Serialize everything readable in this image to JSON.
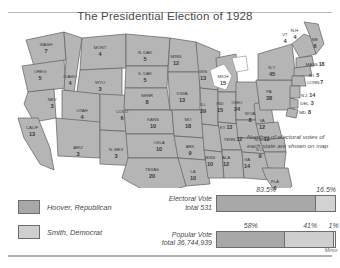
{
  "map": {
    "title": "The Presidential Election of 1928",
    "annotation": "Number of electoral votes of each state are shown on map",
    "states": [
      {
        "name": "WASH",
        "votes": "7",
        "x": 42,
        "y": 30,
        "layout": "stack"
      },
      {
        "name": "OREG",
        "votes": "5",
        "x": 36,
        "y": 57,
        "layout": "stack"
      },
      {
        "name": "IDAHO",
        "votes": "4",
        "x": 66,
        "y": 62,
        "layout": "stack"
      },
      {
        "name": "MONT",
        "votes": "4",
        "x": 96,
        "y": 33,
        "layout": "stack"
      },
      {
        "name": "WYO",
        "votes": "3",
        "x": 96,
        "y": 68,
        "layout": "stack"
      },
      {
        "name": "NEV",
        "votes": "3",
        "x": 48,
        "y": 85,
        "layout": "stack"
      },
      {
        "name": "UTAH",
        "votes": "4",
        "x": 78,
        "y": 96,
        "layout": "stack"
      },
      {
        "name": "CALIF",
        "votes": "13",
        "x": 28,
        "y": 113,
        "layout": "stack"
      },
      {
        "name": "ARIZ",
        "votes": "3",
        "x": 74,
        "y": 133,
        "layout": "stack"
      },
      {
        "name": "COLO",
        "votes": "6",
        "x": 118,
        "y": 97,
        "layout": "stack"
      },
      {
        "name": "N. MEX",
        "votes": "3",
        "x": 112,
        "y": 135,
        "layout": "stack"
      },
      {
        "name": "N. DAK",
        "votes": "5",
        "x": 141,
        "y": 38,
        "layout": "stack"
      },
      {
        "name": "S. DAK",
        "votes": "5",
        "x": 141,
        "y": 59,
        "layout": "stack"
      },
      {
        "name": "NEBR",
        "votes": "8",
        "x": 143,
        "y": 81,
        "layout": "stack"
      },
      {
        "name": "KANS",
        "votes": "10",
        "x": 149,
        "y": 105,
        "layout": "stack"
      },
      {
        "name": "OKLA",
        "votes": "10",
        "x": 155,
        "y": 128,
        "layout": "stack"
      },
      {
        "name": "TEXAS",
        "votes": "20",
        "x": 148,
        "y": 155,
        "layout": "stack"
      },
      {
        "name": "MINN",
        "votes": "12",
        "x": 172,
        "y": 42,
        "layout": "stack"
      },
      {
        "name": "IOWA",
        "votes": "13",
        "x": 178,
        "y": 79,
        "layout": "stack"
      },
      {
        "name": "MO",
        "votes": "18",
        "x": 184,
        "y": 105,
        "layout": "stack"
      },
      {
        "name": "ARK",
        "votes": "9",
        "x": 186,
        "y": 132,
        "layout": "stack"
      },
      {
        "name": "LA",
        "votes": "10",
        "x": 189,
        "y": 157,
        "layout": "stack"
      },
      {
        "name": "WIS",
        "votes": "13",
        "x": 199,
        "y": 57,
        "layout": "stack"
      },
      {
        "name": "ILL",
        "votes": "29",
        "x": 199,
        "y": 90,
        "layout": "stack"
      },
      {
        "name": "MISS",
        "votes": "10",
        "x": 206,
        "y": 143,
        "layout": "stack"
      },
      {
        "name": "MICH",
        "votes": "15",
        "x": 219,
        "y": 62,
        "layout": "stack"
      },
      {
        "name": "IND",
        "votes": "15",
        "x": 216,
        "y": 89,
        "layout": "stack"
      },
      {
        "name": "ALA",
        "votes": "12",
        "x": 222,
        "y": 143,
        "layout": "stack"
      },
      {
        "name": "OHIO",
        "votes": "24",
        "x": 233,
        "y": 88,
        "layout": "stack"
      },
      {
        "name": "KY",
        "votes": "13",
        "x": 222,
        "y": 110,
        "layout": "inline"
      },
      {
        "name": "TENN",
        "votes": "12",
        "x": 229,
        "y": 122,
        "layout": "inline"
      },
      {
        "name": "GA",
        "votes": "14",
        "x": 243,
        "y": 145,
        "layout": "stack"
      },
      {
        "name": "W.VA",
        "votes": "8",
        "x": 246,
        "y": 99,
        "layout": "stack"
      },
      {
        "name": "VA",
        "votes": "12",
        "x": 258,
        "y": 106,
        "layout": "stack"
      },
      {
        "name": "N.C.",
        "votes": "12",
        "x": 258,
        "y": 122,
        "layout": "inline"
      },
      {
        "name": "S.C.",
        "votes": "9",
        "x": 256,
        "y": 135,
        "layout": "stack"
      },
      {
        "name": "FLA",
        "votes": "6",
        "x": 271,
        "y": 167,
        "layout": "stack"
      },
      {
        "name": "PA",
        "votes": "38",
        "x": 265,
        "y": 77,
        "layout": "stack"
      },
      {
        "name": "N.Y.",
        "votes": "45",
        "x": 268,
        "y": 53,
        "layout": "stack"
      },
      {
        "name": "VT",
        "votes": "4",
        "x": 281,
        "y": 20,
        "layout": "stack"
      },
      {
        "name": "N.H.",
        "votes": "4",
        "x": 291,
        "y": 16,
        "layout": "stack"
      },
      {
        "name": "ME",
        "votes": "6",
        "x": 311,
        "y": 25,
        "layout": "stack"
      },
      {
        "name": "MASS",
        "votes": "18",
        "x": 311,
        "y": 47,
        "layout": "inline"
      },
      {
        "name": "R.I.",
        "votes": "5",
        "x": 310,
        "y": 58,
        "layout": "inline"
      },
      {
        "name": "CONN",
        "votes": "7",
        "x": 311,
        "y": 65,
        "layout": "inline"
      },
      {
        "name": "N.J.",
        "votes": "14",
        "x": 304,
        "y": 78,
        "layout": "inline"
      },
      {
        "name": "DEL.",
        "votes": "3",
        "x": 303,
        "y": 86,
        "layout": "inline"
      },
      {
        "name": "MD.",
        "votes": "8",
        "x": 301,
        "y": 95,
        "layout": "inline"
      }
    ]
  },
  "legend": {
    "items": [
      {
        "label": "Hoover, Republican",
        "color": "#a8a8a8"
      },
      {
        "label": "Smith, Democrat",
        "color": "#cfcfcf"
      }
    ]
  },
  "chart_data": {
    "type": "bar",
    "title": "The Presidential Election of 1928",
    "orientation": "horizontal-stacked",
    "bars": [
      {
        "caption_line1": "Electoral Vote",
        "caption_line2": "total 531",
        "segments": [
          {
            "name": "Hoover, Republican",
            "label": "83.5%",
            "value": 83.5,
            "color": "#a8a8a8"
          },
          {
            "name": "Smith, Democrat",
            "label": "16.5%",
            "value": 16.5,
            "color": "#d2d2d2"
          }
        ]
      },
      {
        "caption_line1": "Popular Vote",
        "caption_line2": "total 36,744,939",
        "segments": [
          {
            "name": "Hoover, Republican",
            "label": "58%",
            "value": 58,
            "color": "#a8a8a8"
          },
          {
            "name": "Smith, Democrat",
            "label": "41%",
            "value": 41,
            "color": "#cfcfcf"
          },
          {
            "name": "Minor",
            "label": "1%",
            "value": 1,
            "color": "#ededed",
            "note": "Minor"
          }
        ]
      }
    ]
  }
}
